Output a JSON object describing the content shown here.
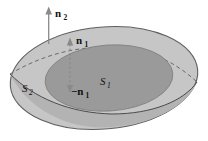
{
  "figure": {
    "background": "#ffffff",
    "colors": {
      "surface_outer": "#c6c6c6",
      "surface_rim": "#b3b3b3",
      "surface_inner": "#9a9a9a",
      "outline": "#5f5f5f",
      "inner_outline": "#7d7d7d",
      "curve_front": "#4a4a4a",
      "curve_hidden": "#6a6a6a",
      "arrow": "#8a8a8a",
      "label": "#111111"
    },
    "labels": {
      "n2": {
        "base": "n",
        "sub": "2"
      },
      "n1": {
        "base": "n",
        "sub": "1"
      },
      "neg_n1": {
        "base": "−n",
        "sub": "1"
      },
      "s1": {
        "base": "S",
        "sub": "1"
      },
      "s2": {
        "base": "S",
        "sub": "2"
      }
    }
  }
}
